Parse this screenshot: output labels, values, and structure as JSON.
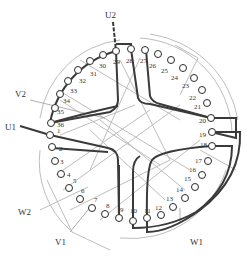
{
  "diagram": {
    "title": "",
    "type": "36-slot three-phase stator winding diagram",
    "slot_count": 36,
    "slots": [
      "1",
      "2",
      "3",
      "4",
      "5",
      "6",
      "7",
      "8",
      "9",
      "10",
      "11",
      "12",
      "13",
      "14",
      "15",
      "16",
      "17",
      "18",
      "19",
      "20",
      "21",
      "22",
      "23",
      "24",
      "25",
      "26",
      "27",
      "28",
      "29",
      "30",
      "31",
      "32",
      "33",
      "34",
      "35",
      "36"
    ],
    "terminals": {
      "U1": "U1",
      "U2": "U2",
      "V1": "V1",
      "V2": "V2",
      "W1": "W1",
      "W2": "W2"
    },
    "colors": {
      "heavy_coil": "#3a3a3a",
      "light_coil": "#b8b8b8",
      "slot_circle": "#2a2a2a",
      "text": "#333333",
      "background": "#ffffff"
    }
  }
}
